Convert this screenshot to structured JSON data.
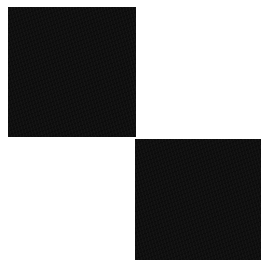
{
  "canvas": {
    "width": 263,
    "height": 260,
    "background": "#ffffff"
  },
  "squares": [
    {
      "id": "top-left",
      "color": "#0f0f0f",
      "x": 8,
      "y": 7,
      "width": 128,
      "height": 130
    },
    {
      "id": "bottom-right",
      "color": "#0f0f0f",
      "x": 135,
      "y": 139,
      "width": 126,
      "height": 121
    }
  ]
}
